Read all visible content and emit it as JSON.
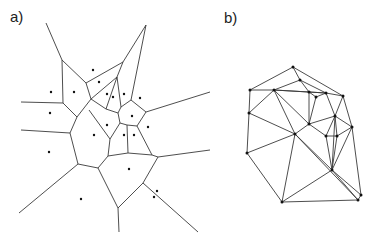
{
  "panels": {
    "a": {
      "label": "a)",
      "type": "voronoi",
      "edges": [
        [
          46,
          23,
          62,
          60
        ],
        [
          62,
          60,
          86,
          83
        ],
        [
          86,
          83,
          123,
          62
        ],
        [
          123,
          62,
          146,
          25
        ],
        [
          146,
          25,
          131,
          100
        ],
        [
          62,
          60,
          63,
          103
        ],
        [
          63,
          103,
          21,
          102
        ],
        [
          63,
          103,
          77,
          117
        ],
        [
          86,
          83,
          91,
          99
        ],
        [
          91,
          99,
          77,
          117
        ],
        [
          91,
          99,
          117,
          77
        ],
        [
          117,
          77,
          123,
          62
        ],
        [
          117,
          77,
          106,
          109
        ],
        [
          117,
          77,
          121,
          107
        ],
        [
          91,
          99,
          106,
          109
        ],
        [
          106,
          109,
          118,
          113
        ],
        [
          118,
          113,
          121,
          107
        ],
        [
          121,
          107,
          131,
          100
        ],
        [
          131,
          100,
          146,
          112
        ],
        [
          146,
          112,
          137,
          126
        ],
        [
          137,
          126,
          127,
          125
        ],
        [
          127,
          125,
          120,
          123
        ],
        [
          120,
          123,
          118,
          113
        ],
        [
          146,
          112,
          210,
          92
        ],
        [
          77,
          117,
          70,
          133
        ],
        [
          70,
          133,
          21,
          130
        ],
        [
          70,
          133,
          78,
          164
        ],
        [
          89,
          110,
          110,
          139
        ],
        [
          110,
          139,
          108,
          156
        ],
        [
          120,
          123,
          110,
          139
        ],
        [
          127,
          125,
          128,
          153
        ],
        [
          137,
          126,
          152,
          155
        ],
        [
          108,
          156,
          128,
          153
        ],
        [
          128,
          153,
          152,
          155
        ],
        [
          152,
          155,
          158,
          157
        ],
        [
          158,
          157,
          210,
          150
        ],
        [
          78,
          164,
          98,
          168
        ],
        [
          98,
          168,
          108,
          156
        ],
        [
          78,
          164,
          19,
          213
        ],
        [
          98,
          168,
          118,
          208
        ],
        [
          118,
          208,
          119,
          232
        ],
        [
          118,
          208,
          143,
          183
        ],
        [
          143,
          183,
          158,
          157
        ],
        [
          143,
          183,
          198,
          232
        ]
      ],
      "sites": [
        [
          93,
          70
        ],
        [
          99,
          82
        ],
        [
          51,
          92
        ],
        [
          74,
          92
        ],
        [
          107,
          94
        ],
        [
          113,
          97
        ],
        [
          124,
          94
        ],
        [
          140,
          98
        ],
        [
          50,
          113
        ],
        [
          107,
          125
        ],
        [
          132,
          116
        ],
        [
          148,
          127
        ],
        [
          94,
          135
        ],
        [
          124,
          135
        ],
        [
          134,
          135
        ],
        [
          49,
          152
        ],
        [
          129,
          169
        ],
        [
          81,
          199
        ],
        [
          157,
          191
        ],
        [
          154,
          197
        ]
      ]
    },
    "b": {
      "label": "b)",
      "type": "delaunay",
      "points": [
        [
          293,
          67
        ],
        [
          300,
          80
        ],
        [
          250,
          90
        ],
        [
          274,
          90
        ],
        [
          309,
          92
        ],
        [
          316,
          97
        ],
        [
          326,
          93
        ],
        [
          343,
          96
        ],
        [
          249,
          113
        ],
        [
          335,
          116
        ],
        [
          309,
          124
        ],
        [
          352,
          127
        ],
        [
          295,
          134
        ],
        [
          326,
          136
        ],
        [
          337,
          136
        ],
        [
          247,
          153
        ],
        [
          332,
          170
        ],
        [
          282,
          202
        ],
        [
          361,
          195
        ],
        [
          358,
          200
        ]
      ],
      "edges": [
        [
          0,
          1
        ],
        [
          0,
          2
        ],
        [
          0,
          7
        ],
        [
          1,
          3
        ],
        [
          1,
          4
        ],
        [
          1,
          6
        ],
        [
          2,
          3
        ],
        [
          2,
          8
        ],
        [
          3,
          4
        ],
        [
          3,
          6
        ],
        [
          3,
          8
        ],
        [
          3,
          12
        ],
        [
          3,
          10
        ],
        [
          4,
          6
        ],
        [
          4,
          5
        ],
        [
          4,
          10
        ],
        [
          5,
          6
        ],
        [
          5,
          10
        ],
        [
          6,
          7
        ],
        [
          6,
          9
        ],
        [
          7,
          11
        ],
        [
          7,
          9
        ],
        [
          8,
          12
        ],
        [
          8,
          15
        ],
        [
          9,
          10
        ],
        [
          9,
          11
        ],
        [
          9,
          13
        ],
        [
          9,
          14
        ],
        [
          9,
          16
        ],
        [
          10,
          12
        ],
        [
          10,
          13
        ],
        [
          11,
          14
        ],
        [
          11,
          16
        ],
        [
          11,
          18
        ],
        [
          12,
          15
        ],
        [
          12,
          17
        ],
        [
          12,
          16
        ],
        [
          13,
          14
        ],
        [
          13,
          16
        ],
        [
          14,
          16
        ],
        [
          15,
          17
        ],
        [
          16,
          17
        ],
        [
          16,
          18
        ],
        [
          16,
          19
        ],
        [
          17,
          19
        ],
        [
          18,
          19
        ],
        [
          12,
          19
        ]
      ]
    }
  },
  "colors": {
    "line": "#3a3a3a",
    "point": "#111111",
    "background": "#ffffff"
  }
}
